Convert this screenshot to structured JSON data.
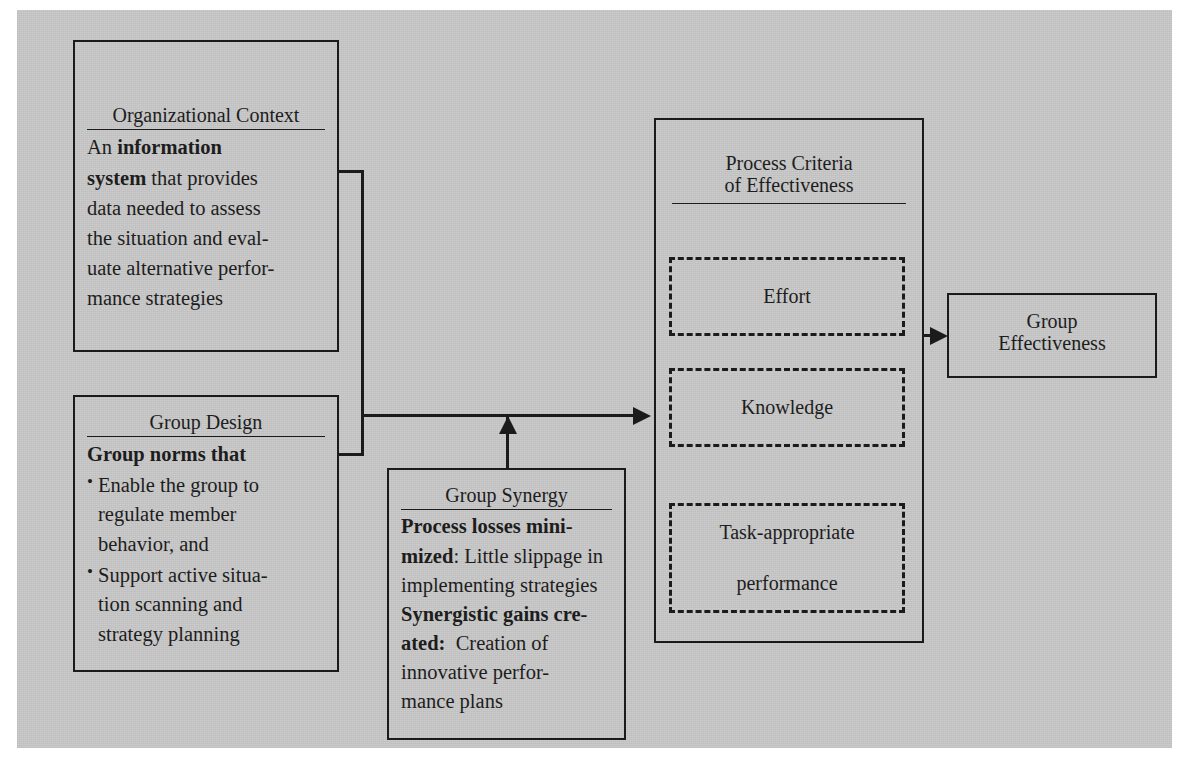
{
  "diagram": {
    "background_color": "#c9c9c9",
    "line_color": "#1b1b1b"
  },
  "organizational_context": {
    "title": "Organizational Context",
    "lead_plain": "An ",
    "lead_bold": "information system",
    "body": " that provides data needed to assess the situation and eval-uate alternative perfor-mance strategies",
    "body_lines": [
      "An information",
      "system that provides",
      "data needed to assess",
      "the situation and eval-",
      "uate alternative perfor-",
      "mance strategies"
    ]
  },
  "group_design": {
    "title": "Group Design",
    "heading": "Group norms that",
    "bullets": [
      "Enable the group to regulate member behavior, and",
      "Support active situa-tion scanning and strategy planning"
    ],
    "bullet_labels": [
      "Enable the group to regulate member behavior, and",
      "Support active situation scanning and strategy planning"
    ]
  },
  "group_synergy": {
    "title": "Group Synergy",
    "item1_bold": "Process losses mini-mized",
    "item1_rest": ": Little slippage in implementing strategies",
    "item2_bold": "Synergistic gains cre-ated:",
    "item2_rest": " Creation of innovative perfor-mance plans"
  },
  "process_criteria": {
    "title_line1": "Process Criteria",
    "title_line2": "of Effectiveness",
    "criteria": [
      {
        "label": "Effort"
      },
      {
        "label": "Knowledge"
      },
      {
        "label": "Task-appropriate",
        "label2": "performance"
      }
    ]
  },
  "group_effectiveness": {
    "line1": "Group",
    "line2": "Effectiveness"
  }
}
